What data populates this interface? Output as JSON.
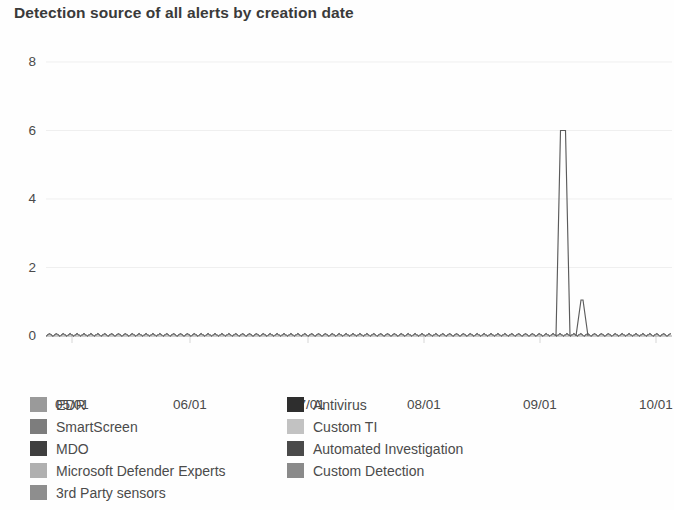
{
  "chart_title": "Detection source of all alerts by creation date",
  "chart_data": {
    "type": "line",
    "title": "Detection source of all alerts by creation date",
    "xlabel": "",
    "ylabel": "",
    "ylim": [
      0,
      8
    ],
    "y_ticks": [
      0,
      2,
      4,
      6,
      8
    ],
    "x_ticks": [
      "05/01",
      "06/01",
      "07/01",
      "08/01",
      "09/01",
      "10/01"
    ],
    "x_range": [
      "05/01",
      "10/15"
    ],
    "grid": true,
    "legend_position": "bottom",
    "series": [
      {
        "name": "EDR",
        "color": "#9a9a9a",
        "peak_value": 6,
        "peak_x": "09/08"
      },
      {
        "name": "SmartScreen",
        "color": "#7d7d7d",
        "peak_value": 0
      },
      {
        "name": "MDO",
        "color": "#3f3f3f",
        "peak_value": 0
      },
      {
        "name": "Microsoft Defender Experts",
        "color": "#b0b0b0",
        "peak_value": 0
      },
      {
        "name": "3rd Party sensors",
        "color": "#8e8e8e",
        "peak_value": 0
      },
      {
        "name": "Antivirus",
        "color": "#2e2e2e",
        "peak_value": 1,
        "peak_x": "09/13"
      },
      {
        "name": "Custom TI",
        "color": "#c2c2c2",
        "peak_value": 0
      },
      {
        "name": "Automated Investigation",
        "color": "#4a4a4a",
        "peak_value": 0
      },
      {
        "name": "Custom Detection",
        "color": "#8a8a8a",
        "peak_value": 0
      }
    ],
    "annotations": [
      {
        "label": "tall spike",
        "value": 6
      },
      {
        "label": "short spike",
        "value": 1
      }
    ]
  },
  "axes": {
    "y_labels": [
      "8",
      "6",
      "4",
      "2",
      "0"
    ],
    "x_labels": [
      "05/01",
      "06/01",
      "07/01",
      "08/01",
      "09/01",
      "10/01"
    ]
  },
  "legend": {
    "left_column": [
      {
        "label": "EDR",
        "color": "#9a9a9a"
      },
      {
        "label": "SmartScreen",
        "color": "#7d7d7d"
      },
      {
        "label": "MDO",
        "color": "#3f3f3f"
      },
      {
        "label": "Microsoft Defender Experts",
        "color": "#b0b0b0"
      },
      {
        "label": "3rd Party sensors",
        "color": "#8e8e8e"
      }
    ],
    "right_column": [
      {
        "label": "Antivirus",
        "color": "#2e2e2e"
      },
      {
        "label": "Custom TI",
        "color": "#c2c2c2"
      },
      {
        "label": "Automated Investigation",
        "color": "#4a4a4a"
      },
      {
        "label": "Custom Detection",
        "color": "#8a8a8a"
      }
    ]
  }
}
